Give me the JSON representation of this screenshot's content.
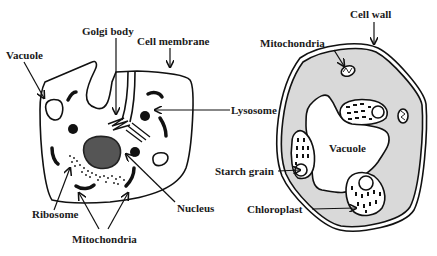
{
  "animal_cell": {
    "labels": {
      "vacuole": "Vacuole",
      "golgi_body": "Golgi body",
      "cell_membrane": "Cell membrane",
      "lysosome": "Lysosome",
      "ribosome": "Ribosome",
      "nucleus": "Nucleus",
      "mitochondria": "Mitochondria"
    }
  },
  "plant_cell": {
    "labels": {
      "cell_wall": "Cell wall",
      "mitochondria": "Mitochondria",
      "vacuole": "Vacuole",
      "starch_grain": "Starch grain",
      "chloroplast": "Chloroplast"
    }
  },
  "colors": {
    "outline": "#111111",
    "nucleus_fill": "#555555",
    "cytoplasm_plant": "#d9d9d9",
    "background": "#ffffff"
  }
}
